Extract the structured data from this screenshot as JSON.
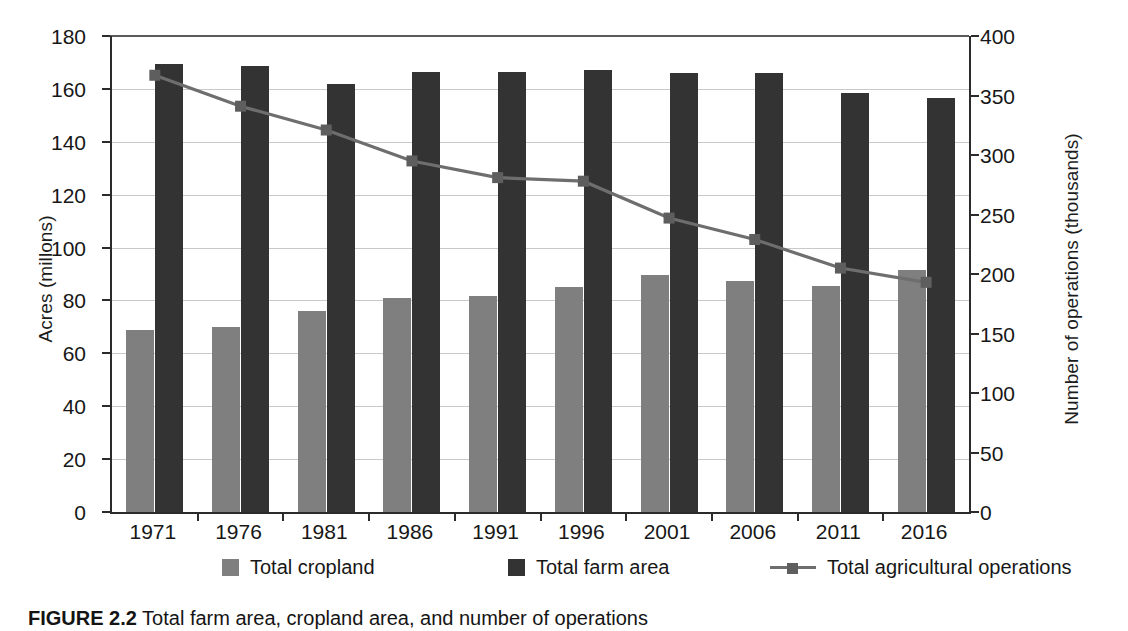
{
  "figure": {
    "caption_label": "FIGURE 2.2",
    "caption_text": " Total farm area, cropland area, and number of operations"
  },
  "axes": {
    "left_title": "Acres (millons)",
    "right_title": "Number of operations (thousands)",
    "left_ticks": [
      "0",
      "20",
      "40",
      "60",
      "80",
      "100",
      "120",
      "140",
      "160",
      "180"
    ],
    "right_ticks": [
      "0",
      "50",
      "100",
      "150",
      "200",
      "250",
      "300",
      "350",
      "400"
    ]
  },
  "legend": {
    "items": [
      {
        "label": "Total cropland",
        "marker": "square-swatch",
        "color": "#7f7f7f"
      },
      {
        "label": "Total farm area",
        "marker": "square-swatch",
        "color": "#333333"
      },
      {
        "label": "Total agricultural operations",
        "marker": "line-with-square",
        "color": "#6e6e6e"
      }
    ]
  },
  "chart_data": {
    "type": "bar",
    "title": "FIGURE 2.2 Total farm area, cropland area, and number of operations",
    "xlabel": "",
    "ylabel": "Acres (millons)",
    "y2label": "Number of operations (thousands)",
    "ylim": [
      0,
      180
    ],
    "y2lim": [
      0,
      400
    ],
    "yticks": [
      0,
      20,
      40,
      60,
      80,
      100,
      120,
      140,
      160,
      180
    ],
    "y2ticks": [
      0,
      50,
      100,
      150,
      200,
      250,
      300,
      350,
      400
    ],
    "grid": true,
    "legend_position": "bottom",
    "categories": [
      "1971",
      "1976",
      "1981",
      "1986",
      "1991",
      "1996",
      "2001",
      "2006",
      "2011",
      "2016"
    ],
    "series": [
      {
        "name": "Total cropland",
        "type": "bar",
        "axis": "left",
        "color": "#7f7f7f",
        "values": [
          69,
          70,
          76,
          81,
          81.5,
          85,
          89.5,
          87.5,
          85.5,
          91.5
        ]
      },
      {
        "name": "Total farm area",
        "type": "bar",
        "axis": "left",
        "color": "#333333",
        "values": [
          169.5,
          168.5,
          162,
          166.5,
          166.5,
          167,
          166,
          166,
          158.5,
          156.5
        ]
      },
      {
        "name": "Total agricultural operations",
        "type": "line",
        "axis": "right",
        "color": "#6e6e6e",
        "marker": "square",
        "values": [
          367,
          341,
          321,
          295,
          281,
          278,
          247,
          229,
          205,
          193
        ]
      }
    ]
  }
}
